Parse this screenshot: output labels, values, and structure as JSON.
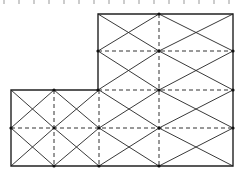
{
  "diagram": {
    "type": "finite-element-mesh",
    "colors": {
      "solid": "#222222",
      "dashed": "#333333",
      "node": "#111111",
      "background": "#ffffff"
    },
    "top_ticks_x": [
      4,
      19,
      34,
      49,
      64,
      79,
      94,
      109,
      124,
      139,
      154,
      169,
      184,
      199,
      214,
      229
    ],
    "outline": [
      [
        98,
        14
      ],
      [
        233,
        14
      ],
      [
        233,
        166
      ],
      [
        11,
        166
      ],
      [
        11,
        90
      ],
      [
        98,
        90
      ]
    ],
    "cells": [
      [
        98,
        14,
        159,
        51
      ],
      [
        159,
        14,
        233,
        51
      ],
      [
        98,
        51,
        159,
        90
      ],
      [
        159,
        51,
        233,
        90
      ],
      [
        11,
        90,
        54,
        128
      ],
      [
        54,
        90,
        99,
        128
      ],
      [
        99,
        90,
        159,
        128
      ],
      [
        159,
        90,
        233,
        128
      ],
      [
        11,
        128,
        54,
        166
      ],
      [
        54,
        128,
        99,
        166
      ],
      [
        99,
        128,
        159,
        166
      ],
      [
        159,
        128,
        233,
        166
      ]
    ],
    "dashed_lines": [
      [
        98,
        51,
        233,
        51
      ],
      [
        98,
        90,
        233,
        90
      ],
      [
        11,
        128,
        233,
        128
      ],
      [
        159,
        14,
        159,
        166
      ],
      [
        54,
        90,
        54,
        166
      ],
      [
        99,
        90,
        99,
        166
      ]
    ],
    "nodes": [
      [
        98,
        51
      ],
      [
        159,
        51
      ],
      [
        233,
        51
      ],
      [
        98,
        90
      ],
      [
        159,
        90
      ],
      [
        233,
        90
      ],
      [
        11,
        128
      ],
      [
        54,
        128
      ],
      [
        99,
        128
      ],
      [
        159,
        128
      ],
      [
        233,
        128
      ],
      [
        54,
        90
      ],
      [
        54,
        166
      ],
      [
        99,
        166
      ],
      [
        159,
        166
      ],
      [
        159,
        14
      ]
    ]
  }
}
